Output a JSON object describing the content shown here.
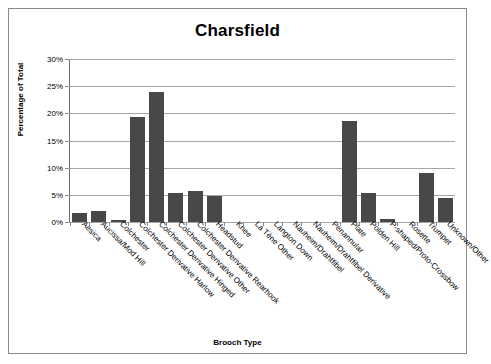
{
  "chart_data": {
    "type": "bar",
    "title": "Charsfield",
    "xlabel": "Brooch Type",
    "ylabel": "Percentage of Total",
    "ylim": [
      0,
      30
    ],
    "ytick_labels": [
      "0%",
      "5%",
      "10%",
      "15%",
      "20%",
      "25%",
      "30%"
    ],
    "ytick_values": [
      0,
      5,
      10,
      15,
      20,
      25,
      30
    ],
    "grid": true,
    "legend": "none",
    "bar_color": "#484848",
    "categories": [
      "Aesica",
      "Aucissa/Mod Hill",
      "Colchester",
      "Colchester Derivative Harlow",
      "Colchester Derivative Hinged",
      "Colchester Derivative Other",
      "Colchester Derivative Rearhook",
      "Headstud",
      "Knee",
      "La Tène Other",
      "Langton Down",
      "Nauheim/Drahtfibel",
      "Nauheim/Drahtfibel Derivative",
      "Penannular",
      "Plate",
      "Polden Hill",
      "P-shaped/Proto-Crossbow",
      "Rosette",
      "Trumpet",
      "Unknown/Other"
    ],
    "values": [
      1.6,
      2.1,
      0.4,
      19.4,
      24.0,
      5.3,
      5.8,
      4.8,
      0,
      0,
      0,
      0,
      0,
      0,
      18.5,
      5.4,
      0.5,
      0,
      9.0,
      4.4
    ]
  }
}
